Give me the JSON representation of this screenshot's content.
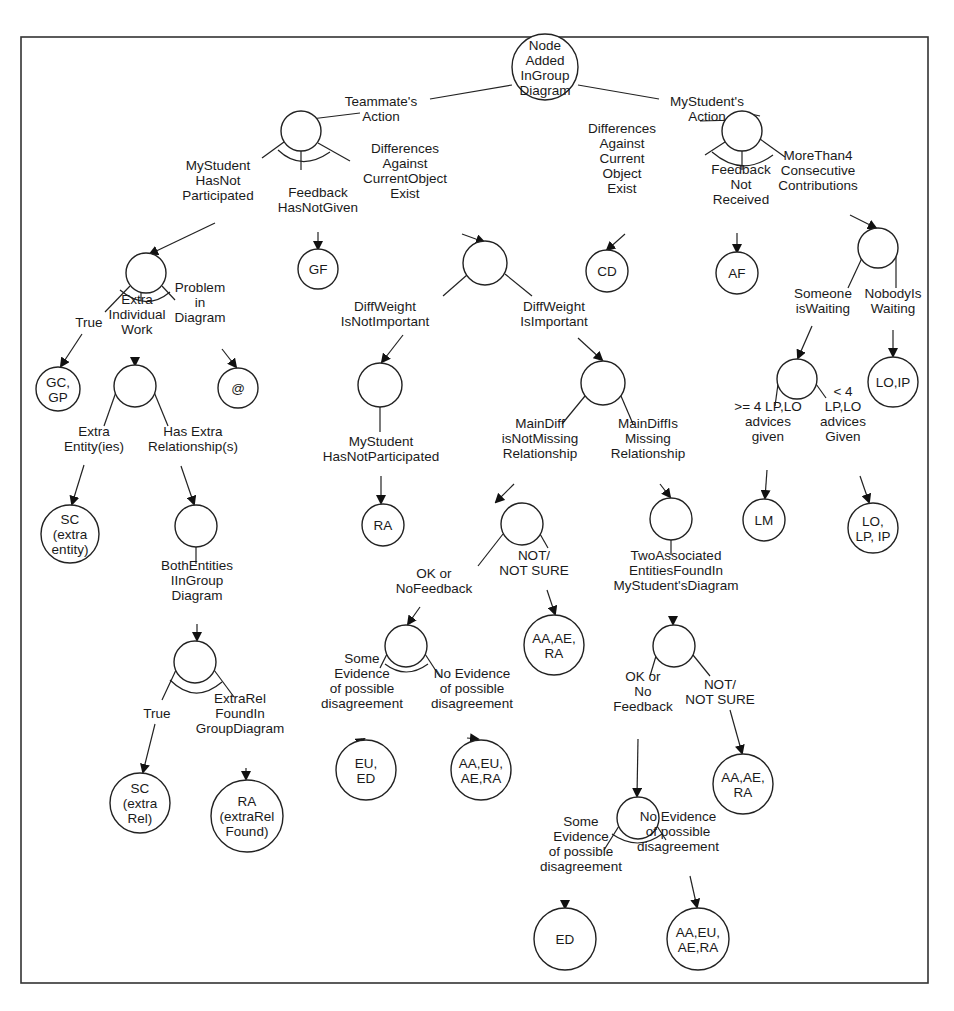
{
  "diagram": {
    "type": "decision-tree",
    "root": {
      "id": "root",
      "lines": [
        "Node",
        "Added",
        "InGroup",
        "Diagram"
      ]
    },
    "nodes": [
      {
        "id": "root",
        "x": 545,
        "y": 67,
        "r": 33,
        "lines": [
          "Node",
          "Added",
          "InGroup",
          "Diagram"
        ]
      },
      {
        "id": "n_team",
        "x": 301,
        "y": 131,
        "r": 20,
        "lines": []
      },
      {
        "id": "n_my",
        "x": 742,
        "y": 131,
        "r": 20,
        "lines": []
      },
      {
        "id": "n_msnp",
        "x": 146,
        "y": 273,
        "r": 20,
        "lines": []
      },
      {
        "id": "gf",
        "x": 318,
        "y": 269,
        "r": 20,
        "lines": [
          "GF"
        ]
      },
      {
        "id": "n_diff",
        "x": 485,
        "y": 263,
        "r": 22,
        "lines": []
      },
      {
        "id": "cd",
        "x": 607,
        "y": 271,
        "r": 21,
        "lines": [
          "CD"
        ]
      },
      {
        "id": "af",
        "x": 737,
        "y": 273,
        "r": 21,
        "lines": [
          "AF"
        ]
      },
      {
        "id": "n_more4",
        "x": 878,
        "y": 248,
        "r": 20,
        "lines": []
      },
      {
        "id": "gcgp",
        "x": 58,
        "y": 389,
        "r": 22,
        "lines": [
          "GC,",
          "GP"
        ]
      },
      {
        "id": "n_extra",
        "x": 135,
        "y": 386,
        "r": 21,
        "lines": []
      },
      {
        "id": "at",
        "x": 238,
        "y": 388,
        "r": 20,
        "lines": [
          "@"
        ]
      },
      {
        "id": "n_dwni",
        "x": 380,
        "y": 385,
        "r": 22,
        "lines": []
      },
      {
        "id": "n_dwi",
        "x": 603,
        "y": 383,
        "r": 22,
        "lines": []
      },
      {
        "id": "n_wait",
        "x": 797,
        "y": 379,
        "r": 20,
        "lines": []
      },
      {
        "id": "loip",
        "x": 893,
        "y": 382,
        "r": 25,
        "lines": [
          "LO,IP"
        ]
      },
      {
        "id": "sc1",
        "x": 70,
        "y": 534,
        "r": 29,
        "lines": [
          "SC",
          "(extra",
          "entity)"
        ]
      },
      {
        "id": "n_rel",
        "x": 196,
        "y": 526,
        "r": 21,
        "lines": []
      },
      {
        "id": "ra1",
        "x": 383,
        "y": 525,
        "r": 21,
        "lines": [
          "RA"
        ]
      },
      {
        "id": "n_notmiss",
        "x": 522,
        "y": 524,
        "r": 21,
        "lines": []
      },
      {
        "id": "n_miss",
        "x": 671,
        "y": 519,
        "r": 21,
        "lines": []
      },
      {
        "id": "lm",
        "x": 764,
        "y": 520,
        "r": 21,
        "lines": [
          "LM"
        ]
      },
      {
        "id": "lolpip",
        "x": 873,
        "y": 528,
        "r": 25,
        "lines": [
          "LO,",
          "LP, IP"
        ]
      },
      {
        "id": "n_both",
        "x": 195,
        "y": 662,
        "r": 21,
        "lines": []
      },
      {
        "id": "n_okfb",
        "x": 406,
        "y": 646,
        "r": 21,
        "lines": []
      },
      {
        "id": "aaaera1",
        "x": 554,
        "y": 645,
        "r": 30,
        "lines": [
          "AA,AE,",
          "RA"
        ]
      },
      {
        "id": "n_two",
        "x": 674,
        "y": 646,
        "r": 21,
        "lines": []
      },
      {
        "id": "aaaera2",
        "x": 743,
        "y": 784,
        "r": 30,
        "lines": [
          "AA,AE,",
          "RA"
        ]
      },
      {
        "id": "eued",
        "x": 366,
        "y": 770,
        "r": 30,
        "lines": [
          "EU,",
          "ED"
        ]
      },
      {
        "id": "aaeuaera1",
        "x": 481,
        "y": 770,
        "r": 30,
        "lines": [
          "AA,EU,",
          "AE,RA"
        ]
      },
      {
        "id": "n_ok2",
        "x": 638,
        "y": 818,
        "r": 21,
        "lines": []
      },
      {
        "id": "sc2",
        "x": 140,
        "y": 803,
        "r": 30,
        "lines": [
          "SC",
          "(extra",
          "Rel)"
        ]
      },
      {
        "id": "ra2",
        "x": 247,
        "y": 816,
        "r": 36,
        "lines": [
          "RA",
          "(extraRel",
          "Found)"
        ]
      },
      {
        "id": "ed",
        "x": 565,
        "y": 939,
        "r": 31,
        "lines": [
          "ED"
        ]
      },
      {
        "id": "aaeuaera2",
        "x": 698,
        "y": 939,
        "r": 31,
        "lines": [
          "AA,EU,",
          "AE,RA"
        ]
      }
    ],
    "labels": [
      {
        "id": "l_team",
        "x": 381,
        "y": 108,
        "lines": [
          "Teammate's",
          "Action"
        ]
      },
      {
        "id": "l_my",
        "x": 707,
        "y": 108,
        "lines": [
          "MyStudent's",
          "Action"
        ]
      },
      {
        "id": "l_msnp",
        "x": 218,
        "y": 180,
        "lines": [
          "MyStudent",
          "HasNot",
          "Participated"
        ]
      },
      {
        "id": "l_fb",
        "x": 318,
        "y": 199,
        "lines": [
          "Feedback",
          "HasNotGiven"
        ]
      },
      {
        "id": "l_diffagainst",
        "x": 405,
        "y": 170,
        "lines": [
          "Differences",
          "Against",
          "CurrentObject",
          "Exist"
        ]
      },
      {
        "id": "l_diffcur",
        "x": 622,
        "y": 158,
        "lines": [
          "Differences",
          "Against",
          "Current",
          "Object",
          "Exist"
        ]
      },
      {
        "id": "l_fbnr",
        "x": 741,
        "y": 184,
        "lines": [
          "Feedback",
          "Not",
          "Received"
        ]
      },
      {
        "id": "l_more4",
        "x": 818,
        "y": 170,
        "lines": [
          "MoreThan4",
          "Consecutive",
          "Contributions"
        ]
      },
      {
        "id": "l_true1",
        "x": 89,
        "y": 322,
        "lines": [
          "True"
        ]
      },
      {
        "id": "l_extraind",
        "x": 137,
        "y": 314,
        "lines": [
          "Extra",
          "Individual",
          "Work"
        ]
      },
      {
        "id": "l_problem",
        "x": 200,
        "y": 302,
        "lines": [
          "Problem",
          "in",
          "Diagram"
        ]
      },
      {
        "id": "l_dwni",
        "x": 385,
        "y": 313,
        "lines": [
          "DiffWeight",
          "IsNotImportant"
        ]
      },
      {
        "id": "l_dwi",
        "x": 554,
        "y": 313,
        "lines": [
          "DiffWeight",
          "IsImportant"
        ]
      },
      {
        "id": "l_someone",
        "x": 823,
        "y": 300,
        "lines": [
          "Someone",
          "isWaiting"
        ]
      },
      {
        "id": "l_nobody",
        "x": 893,
        "y": 300,
        "lines": [
          "NobodyIs",
          "Waiting"
        ]
      },
      {
        "id": "l_extraent",
        "x": 94,
        "y": 438,
        "lines": [
          "Extra",
          "Entity(ies)"
        ]
      },
      {
        "id": "l_hasextra",
        "x": 193,
        "y": 438,
        "lines": [
          "Has Extra",
          "Relationship(s)"
        ]
      },
      {
        "id": "l_msnp2",
        "x": 381,
        "y": 448,
        "lines": [
          "MyStudent",
          "HasNotParticipated"
        ]
      },
      {
        "id": "l_notmiss",
        "x": 540,
        "y": 438,
        "lines": [
          "MainDiff",
          "isNotMissing",
          "Relationship"
        ]
      },
      {
        "id": "l_miss",
        "x": 648,
        "y": 438,
        "lines": [
          "MainDiffIs",
          "Missing",
          "Relationship"
        ]
      },
      {
        "id": "l_ge4",
        "x": 768,
        "y": 421,
        "lines": [
          ">= 4 LP,LO",
          "advices",
          "given"
        ]
      },
      {
        "id": "l_lt4",
        "x": 843,
        "y": 413,
        "lines": [
          "< 4",
          "LP,LO",
          "advices",
          "Given"
        ]
      },
      {
        "id": "l_bothent",
        "x": 197,
        "y": 580,
        "lines": [
          "BothEntities",
          "IInGroup",
          "Diagram"
        ]
      },
      {
        "id": "l_okfb",
        "x": 434,
        "y": 580,
        "lines": [
          "OK or",
          "NoFeedback"
        ]
      },
      {
        "id": "l_notsure1",
        "x": 534,
        "y": 562,
        "lines": [
          "NOT/",
          "NOT SURE"
        ]
      },
      {
        "id": "l_twoassoc",
        "x": 676,
        "y": 570,
        "lines": [
          "TwoAssociated",
          "EntitiesFoundIn",
          "MyStudent'sDiagram"
        ]
      },
      {
        "id": "l_true2",
        "x": 157,
        "y": 713,
        "lines": [
          "True"
        ]
      },
      {
        "id": "l_extrarel",
        "x": 240,
        "y": 713,
        "lines": [
          "ExtraRel",
          "FoundIn",
          "GroupDiagram"
        ]
      },
      {
        "id": "l_someev1",
        "x": 362,
        "y": 680,
        "lines": [
          "Some",
          "Evidence",
          "of possible",
          "disagreement"
        ]
      },
      {
        "id": "l_noev1",
        "x": 472,
        "y": 688,
        "lines": [
          "No Evidence",
          "of possible",
          "disagreement"
        ]
      },
      {
        "id": "l_ok2",
        "x": 643,
        "y": 691,
        "lines": [
          "OK or",
          "No",
          "Feedback"
        ]
      },
      {
        "id": "l_notsure2",
        "x": 720,
        "y": 691,
        "lines": [
          "NOT/",
          "NOT SURE"
        ]
      },
      {
        "id": "l_someev2",
        "x": 581,
        "y": 843,
        "lines": [
          "Some",
          "Evidence",
          "of possible",
          "disagreement"
        ]
      },
      {
        "id": "l_noev2",
        "x": 678,
        "y": 831,
        "lines": [
          "No Evidence",
          "of possible",
          "disagreement"
        ]
      }
    ]
  }
}
